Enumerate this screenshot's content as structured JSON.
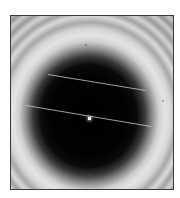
{
  "figure": {
    "palette": {
      "frame_border": "#3a3a3a",
      "dark_core": "#000000",
      "bright_ring": "#e4e4e4",
      "background": "#ffffff",
      "line_color": "#d2d2d2",
      "center_point": "#ffffff"
    },
    "frame": {
      "x": 10,
      "y": 15,
      "width": 164,
      "height": 175
    },
    "dark_disk": {
      "center_x": 88,
      "center_y": 115,
      "radius_x": 62,
      "radius_y": 66
    },
    "lines": [
      {
        "name": "upper-line",
        "x1": 47,
        "y1": 73,
        "x2": 145,
        "y2": 89
      },
      {
        "name": "lower-line",
        "x1": 25,
        "y1": 104,
        "x2": 150,
        "y2": 125
      }
    ],
    "center_point": {
      "x": 88,
      "y": 117
    }
  }
}
